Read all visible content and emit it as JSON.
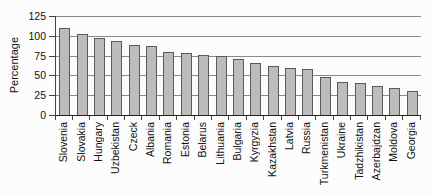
{
  "chart_data": {
    "type": "bar",
    "title": "",
    "xlabel": "",
    "ylabel": "Percentage",
    "ylim": [
      0,
      125
    ],
    "yticks": [
      0,
      25,
      50,
      75,
      100,
      125
    ],
    "grid": true,
    "legend": false,
    "categories": [
      "Slovenia",
      "Slovakia",
      "Hungary",
      "Uzbekistan",
      "Czeck",
      "Albania",
      "Romania",
      "Estonia",
      "Belarus",
      "Lithuania",
      "Bulgaria",
      "Kyrgyzia",
      "Kazakhstan",
      "Latvia",
      "Russia",
      "Turkmenistan",
      "Ukraine",
      "Tadzhikistan",
      "Azerbajdzan",
      "Moldova",
      "Georgia"
    ],
    "values": [
      110,
      102,
      97,
      93,
      89,
      87,
      80,
      78,
      76,
      74,
      71,
      66,
      62,
      59,
      58,
      48,
      42,
      40,
      37,
      34,
      30
    ],
    "colors": {
      "bar_fill": "#bcbcbc",
      "bar_border": "#5a5a5a",
      "gridline": "#8a8a8a",
      "axis": "#444444",
      "text": "#111111",
      "background": "#fcfcfc"
    }
  }
}
